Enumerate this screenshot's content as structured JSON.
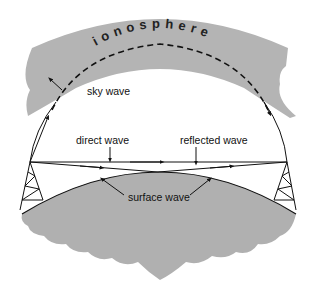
{
  "diagram": {
    "title_label": "ionosphere",
    "labels": {
      "sky_wave": "sky wave",
      "direct_wave": "direct wave",
      "reflected_wave": "reflected wave",
      "surface_wave": "surface wave"
    },
    "colors": {
      "ionosphere_fill": "#b4b4b4",
      "earth_fill": "#b0b0b0",
      "line": "#111111",
      "background": "#ffffff"
    }
  }
}
